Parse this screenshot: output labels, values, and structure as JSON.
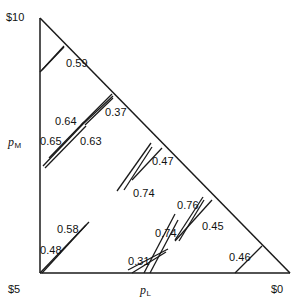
{
  "figure": {
    "width": 301,
    "height": 308,
    "background": "#ffffff",
    "stroke_color": "#1a1a1a"
  },
  "axes": {
    "x_title": "p",
    "x_title_sub": "L",
    "y_title": "p",
    "y_title_sub": "M",
    "corner_top_left": "$10",
    "corner_bottom_left": "$5",
    "corner_bottom_right": "$0"
  },
  "chart_data": {
    "type": "scatter",
    "title": "",
    "xlabel": "pL",
    "ylabel": "pM",
    "grid": false,
    "legend": null,
    "triangle": {
      "apex": [
        40,
        18
      ],
      "bottom_left": [
        40,
        273
      ],
      "bottom_right": [
        290,
        273
      ]
    },
    "axis_ranges": {
      "left_axis_from": "$5",
      "left_axis_to": "$10",
      "bottom_axis_from": "$5",
      "bottom_axis_to": "$0"
    },
    "annotations": [
      {
        "label": "0.59",
        "label_x": 66,
        "label_y": 58,
        "segments": [
          {
            "x1": 40,
            "y1": 72,
            "x2": 64,
            "y2": 47
          },
          {
            "x1": 42,
            "y1": 70,
            "x2": 64,
            "y2": 46
          }
        ]
      },
      {
        "label": "0.37",
        "label_x": 105,
        "label_y": 107,
        "segments": [
          {
            "x1": 81,
            "y1": 125,
            "x2": 112,
            "y2": 94
          },
          {
            "x1": 83,
            "y1": 124,
            "x2": 113,
            "y2": 96
          },
          {
            "x1": 85,
            "y1": 125,
            "x2": 113,
            "y2": 98
          }
        ]
      },
      {
        "label": "0.64",
        "label_x": 55,
        "label_y": 116,
        "segments": [
          {
            "x1": 49,
            "y1": 158,
            "x2": 84,
            "y2": 122
          }
        ]
      },
      {
        "label": "0.65",
        "label_x": 40,
        "label_y": 136,
        "segments": [
          {
            "x1": 43,
            "y1": 166,
            "x2": 83,
            "y2": 124
          }
        ]
      },
      {
        "label": "0.63",
        "label_x": 80,
        "label_y": 136,
        "segments": [
          {
            "x1": 45,
            "y1": 168,
            "x2": 86,
            "y2": 126
          }
        ]
      },
      {
        "label": "0.47",
        "label_x": 152,
        "label_y": 156,
        "segments": [
          {
            "x1": 132,
            "y1": 180,
            "x2": 162,
            "y2": 148
          }
        ]
      },
      {
        "label": "0.74",
        "label_x": 133,
        "label_y": 188,
        "segments": [
          {
            "x1": 117,
            "y1": 191,
            "x2": 151,
            "y2": 143
          },
          {
            "x1": 124,
            "y1": 190,
            "x2": 152,
            "y2": 147
          }
        ]
      },
      {
        "label": "0.76",
        "label_x": 177,
        "label_y": 200,
        "segments": [
          {
            "x1": 175,
            "y1": 240,
            "x2": 203,
            "y2": 197
          },
          {
            "x1": 179,
            "y1": 241,
            "x2": 204,
            "y2": 200
          }
        ]
      },
      {
        "label": "0.45",
        "label_x": 202,
        "label_y": 221,
        "segments": [
          {
            "x1": 175,
            "y1": 241,
            "x2": 212,
            "y2": 200
          }
        ]
      },
      {
        "label": "0.58",
        "label_x": 57,
        "label_y": 224,
        "segments": [
          {
            "x1": 40,
            "y1": 273,
            "x2": 89,
            "y2": 222
          }
        ]
      },
      {
        "label": "0.48",
        "label_x": 40,
        "label_y": 245,
        "segments": [
          {
            "x1": 42,
            "y1": 273,
            "x2": 86,
            "y2": 225
          }
        ]
      },
      {
        "label": "0.31",
        "label_x": 128,
        "label_y": 256,
        "segments": [
          {
            "x1": 128,
            "y1": 270,
            "x2": 168,
            "y2": 249
          },
          {
            "x1": 132,
            "y1": 273,
            "x2": 166,
            "y2": 252
          }
        ]
      },
      {
        "label": "0.74",
        "label_x": 155,
        "label_y": 228,
        "segments": [
          {
            "x1": 144,
            "y1": 273,
            "x2": 175,
            "y2": 214
          },
          {
            "x1": 150,
            "y1": 273,
            "x2": 178,
            "y2": 220
          }
        ]
      },
      {
        "label": "0.46",
        "label_x": 229,
        "label_y": 252,
        "segments": [
          {
            "x1": 235,
            "y1": 273,
            "x2": 262,
            "y2": 246
          }
        ]
      }
    ]
  }
}
